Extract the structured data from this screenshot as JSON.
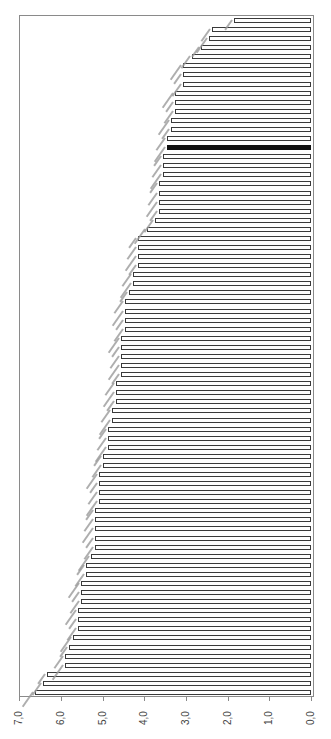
{
  "chart_data": {
    "type": "bar",
    "orientation": "rotated-90 (horizontal bars growing leftward from 0.0 at right edge)",
    "title": "",
    "xlabel": "",
    "ylabel": "",
    "ylim": [
      0,
      7
    ],
    "tick_labels": [
      "7,0",
      "6,0",
      "5,0",
      "4,0",
      "3,0",
      "2,0",
      "1,0",
      "0,0"
    ],
    "tick_values": [
      7,
      6,
      5,
      4,
      3,
      2,
      1,
      0
    ],
    "grid": false,
    "legend": null,
    "category_labels_note": "75 rotated category labels present but illegible at screenshot resolution",
    "highlighted_index": 14,
    "highlight_color": "#111111",
    "bar_fill": "#ffffff",
    "bar_border": "#3a3a3a",
    "values": [
      1.85,
      2.37,
      2.45,
      2.64,
      2.85,
      3.07,
      3.07,
      3.07,
      3.26,
      3.26,
      3.26,
      3.36,
      3.36,
      3.45,
      3.45,
      3.55,
      3.55,
      3.55,
      3.65,
      3.65,
      3.65,
      3.65,
      3.74,
      3.93,
      4.15,
      4.15,
      4.15,
      4.15,
      4.27,
      4.27,
      4.36,
      4.46,
      4.46,
      4.46,
      4.46,
      4.56,
      4.56,
      4.56,
      4.56,
      4.56,
      4.68,
      4.68,
      4.68,
      4.77,
      4.77,
      4.87,
      4.87,
      4.87,
      4.99,
      4.99,
      5.08,
      5.08,
      5.08,
      5.08,
      5.18,
      5.18,
      5.18,
      5.18,
      5.18,
      5.28,
      5.4,
      5.4,
      5.52,
      5.52,
      5.52,
      5.59,
      5.59,
      5.59,
      5.71,
      5.8,
      5.9,
      5.9,
      6.33,
      6.43,
      6.62
    ]
  },
  "layout": {
    "zero_x": 311,
    "px_per_unit": 41.7,
    "first_bar_y": 18,
    "bar_spacing": 9.08,
    "frame": {
      "left": 19,
      "top": 15,
      "right": 314,
      "bottom": 697
    }
  }
}
